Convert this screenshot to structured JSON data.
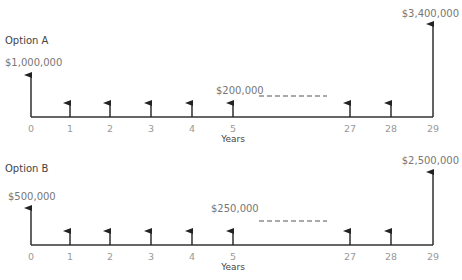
{
  "diagrams": [
    {
      "title": "Option A",
      "axis_label": "Years",
      "ticks": [
        "0",
        "1",
        "2",
        "3",
        "4",
        "5",
        "27",
        "28",
        "29"
      ],
      "initial": {
        "year": "0",
        "label": "$1,000,000"
      },
      "annual": {
        "label": "$200,000",
        "years": [
          "1",
          "2",
          "3",
          "4",
          "5",
          "27",
          "28"
        ]
      },
      "final": {
        "year": "29",
        "label": "$3,400,000"
      }
    },
    {
      "title": "Option B",
      "axis_label": "Years",
      "ticks": [
        "0",
        "1",
        "2",
        "3",
        "4",
        "5",
        "27",
        "28",
        "29"
      ],
      "initial": {
        "year": "0",
        "label": "$500,000"
      },
      "annual": {
        "label": "$250,000",
        "years": [
          "1",
          "2",
          "3",
          "4",
          "5",
          "27",
          "28"
        ]
      },
      "final": {
        "year": "29",
        "label": "$2,500,000"
      }
    }
  ]
}
